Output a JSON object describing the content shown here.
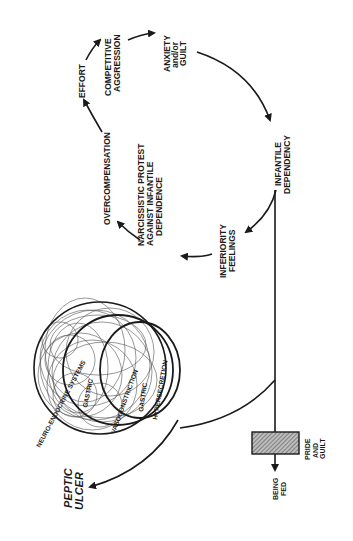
{
  "diagram": {
    "orientation": "rotated-90-ccw",
    "cycle_nodes": [
      {
        "id": "infantile-dependency",
        "lines": [
          "INFANTILE",
          "DEPENDENCY"
        ]
      },
      {
        "id": "inferiority-feelings",
        "lines": [
          "INFERIORITY",
          "FEELINGS"
        ]
      },
      {
        "id": "narcissistic-protest",
        "lines": [
          "NARCISSISTIC  PROTEST",
          "AGAINST INFANTILE",
          "DEPENDENCE"
        ]
      },
      {
        "id": "overcompensation",
        "lines": [
          "OVERCOMPENSATION"
        ]
      },
      {
        "id": "effort",
        "lines": [
          "EFFORT"
        ]
      },
      {
        "id": "competitive-aggression",
        "lines": [
          "COMPETITIVE",
          "AGGRESSION"
        ]
      },
      {
        "id": "anxiety-guilt",
        "lines": [
          "ANXIETY",
          "and/or",
          "GUILT"
        ]
      }
    ],
    "circle_labels": {
      "outer": "NEURO-ENDOCRINE SYSTEMS",
      "middle_1": "GASTRIC",
      "middle_2": "VASOCONSTRICTION",
      "inner_1": "GASTRIC",
      "inner_2": "HYPERSECRETION"
    },
    "outcome": {
      "lines": [
        "PEPTIC",
        "ULCER"
      ]
    },
    "block": {
      "lines": [
        "PRIDE",
        "AND",
        "GUILT"
      ]
    },
    "block_output": {
      "lines": [
        "BEING",
        "FED"
      ]
    },
    "colors": {
      "ink": "#1a1a1a",
      "paper": "#ffffff",
      "hatch": "#555555"
    }
  }
}
